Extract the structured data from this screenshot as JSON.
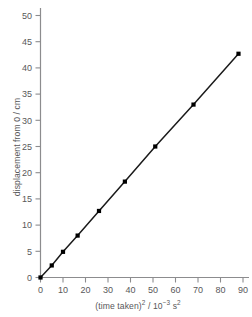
{
  "chart_data": {
    "type": "scatter",
    "title": "",
    "xlabel": "(time taken)2 / 10-3 s2",
    "ylabel": "displacement from 0 / cm",
    "xlabel_parts": {
      "base": "(time taken)",
      "exp1": "2",
      "mid": " / 10",
      "exp2": "−3",
      "unit": " s",
      "exp3": "2"
    },
    "ylabel_text": "displacement from 0 / cm",
    "x": [
      0,
      5,
      10,
      16.5,
      26,
      37.5,
      51,
      68,
      88
    ],
    "y": [
      0,
      2.3,
      4.9,
      8.0,
      12.7,
      18.3,
      25.0,
      33.0,
      42.7
    ],
    "series": [
      {
        "name": "displacement vs (time taken)^2",
        "x": [
          0,
          5,
          10,
          16.5,
          26,
          37.5,
          51,
          68,
          88
        ],
        "values": [
          0,
          2.3,
          4.9,
          8.0,
          12.7,
          18.3,
          25.0,
          33.0,
          42.7
        ]
      }
    ],
    "xlim": [
      0,
      93
    ],
    "ylim": [
      0,
      52
    ],
    "xticks": [
      0,
      10,
      20,
      30,
      40,
      50,
      60,
      70,
      80,
      90
    ],
    "xtick_labels": [
      "0",
      "10",
      "20",
      "30",
      "40",
      "50",
      "60",
      "70",
      "80",
      "90"
    ],
    "yticks": [
      0,
      5,
      10,
      15,
      20,
      25,
      30,
      35,
      40,
      45,
      50
    ],
    "ytick_labels": [
      "0",
      "5",
      "10",
      "15",
      "20",
      "25",
      "30",
      "35",
      "40",
      "45",
      "50"
    ],
    "grid": false,
    "legend": false,
    "legend_position": "none",
    "line_style": "solid",
    "marker": "square",
    "colors": {
      "line": "#1a1a1a",
      "marker": "#000000",
      "axis": "#8c8c8e",
      "tick_text": "#58585a",
      "background": "#ffffff"
    }
  }
}
